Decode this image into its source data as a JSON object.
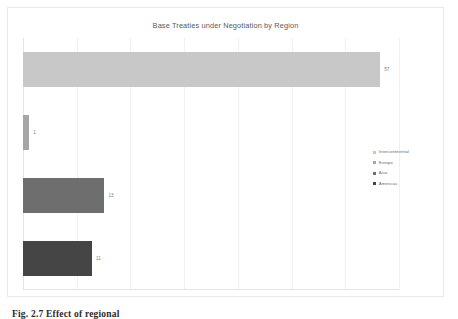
{
  "figure": {
    "caption": "Fig. 2.7  Effect of regional"
  },
  "chart_data": {
    "type": "bar",
    "orientation": "horizontal",
    "title": "Base Treaties under Negotiation by Region",
    "xlabel": "",
    "ylabel": "",
    "categories": [
      "Intercontinental",
      "Europe",
      "Asia",
      "Americas"
    ],
    "values": [
      57,
      1,
      13,
      11
    ],
    "value_labels": [
      "57",
      "1",
      "13",
      "11"
    ],
    "colors": [
      "#c8c8c8",
      "#a6a6a6",
      "#6e6e6e",
      "#454545"
    ],
    "xlim": [
      0,
      60
    ],
    "gridlines": 8,
    "grid": true,
    "axis_tick_labels": [],
    "legend_position": "right",
    "series": [
      {
        "name": "Intercontinental",
        "value": 57,
        "label": "57",
        "color": "#c8c8c8"
      },
      {
        "name": "Europe",
        "value": 1,
        "label": "1",
        "color": "#a6a6a6"
      },
      {
        "name": "Asia",
        "value": 13,
        "label": "13",
        "color": "#6e6e6e"
      },
      {
        "name": "Americas",
        "value": 11,
        "label": "11",
        "color": "#454545"
      }
    ]
  },
  "legend": {
    "items": [
      {
        "label": "Intercontinental",
        "color": "#c8c8c8"
      },
      {
        "label": "Europe",
        "color": "#a6a6a6"
      },
      {
        "label": "Asia",
        "color": "#6e6e6e"
      },
      {
        "label": "Americas",
        "color": "#454545"
      }
    ]
  }
}
